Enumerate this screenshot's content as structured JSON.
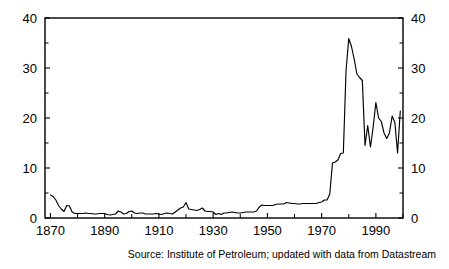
{
  "figure": {
    "background_color": "#ffffff",
    "line_color": "#000000",
    "source_note": "Source: Institute of Petroleum; updated with data from Datastream"
  },
  "chart_data": {
    "type": "line",
    "title": "",
    "subtitle": "",
    "xlabel": "",
    "ylabel": "",
    "xlim": [
      1868,
      2000
    ],
    "ylim": [
      0,
      40
    ],
    "grid": false,
    "legend": null,
    "axes": {
      "left": {
        "ticks": [
          0,
          10,
          20,
          30,
          40
        ],
        "tick_labels": [
          "0",
          "10",
          "20",
          "30",
          "40"
        ],
        "minor_ticks": [
          5,
          15,
          25,
          35
        ]
      },
      "right": {
        "ticks": [
          0,
          10,
          20,
          30,
          40
        ],
        "tick_labels": [
          "0",
          "10",
          "20",
          "30",
          "40"
        ],
        "minor_ticks": [
          5,
          15,
          25,
          35
        ]
      },
      "bottom": {
        "ticks": [
          1870,
          1890,
          1910,
          1930,
          1950,
          1970,
          1990
        ],
        "tick_labels": [
          "1870",
          "1890",
          "1910",
          "1930",
          "1950",
          "1970",
          "1990"
        ],
        "minor_ticks": [
          1880,
          1900,
          1920,
          1940,
          1960,
          1980,
          2000
        ]
      }
    },
    "series": [
      {
        "name": "Crude oil price",
        "x": [
          1870,
          1871,
          1872,
          1873,
          1874,
          1875,
          1876,
          1877,
          1878,
          1879,
          1880,
          1881,
          1882,
          1883,
          1884,
          1885,
          1886,
          1887,
          1888,
          1889,
          1890,
          1891,
          1892,
          1893,
          1894,
          1895,
          1896,
          1897,
          1898,
          1899,
          1900,
          1901,
          1902,
          1903,
          1904,
          1905,
          1906,
          1907,
          1908,
          1909,
          1910,
          1911,
          1912,
          1913,
          1914,
          1915,
          1916,
          1917,
          1918,
          1919,
          1920,
          1921,
          1922,
          1923,
          1924,
          1925,
          1926,
          1927,
          1928,
          1929,
          1930,
          1931,
          1932,
          1933,
          1934,
          1935,
          1936,
          1937,
          1938,
          1939,
          1940,
          1941,
          1942,
          1943,
          1944,
          1945,
          1946,
          1947,
          1948,
          1949,
          1950,
          1951,
          1952,
          1953,
          1954,
          1955,
          1956,
          1957,
          1958,
          1959,
          1960,
          1961,
          1962,
          1963,
          1964,
          1965,
          1966,
          1967,
          1968,
          1969,
          1970,
          1971,
          1972,
          1973,
          1974,
          1975,
          1976,
          1977,
          1978,
          1979,
          1980,
          1981,
          1982,
          1983,
          1984,
          1985,
          1986,
          1987,
          1988,
          1989,
          1990,
          1991,
          1992,
          1993,
          1994,
          1995,
          1996,
          1997,
          1998,
          1999
        ],
        "values": [
          4.6,
          4.3,
          3.6,
          2.5,
          1.8,
          1.3,
          2.5,
          2.4,
          1.2,
          0.9,
          0.9,
          0.9,
          0.9,
          1.0,
          0.9,
          0.9,
          0.8,
          0.8,
          0.9,
          0.9,
          0.9,
          0.7,
          0.6,
          0.7,
          0.8,
          1.4,
          1.2,
          0.8,
          0.9,
          1.3,
          1.4,
          1.0,
          0.9,
          1.0,
          1.0,
          0.8,
          0.8,
          0.8,
          0.8,
          0.9,
          0.8,
          0.7,
          0.9,
          1.0,
          0.9,
          0.8,
          1.2,
          1.6,
          2.0,
          2.2,
          3.1,
          1.8,
          1.7,
          1.6,
          1.5,
          1.7,
          2.0,
          1.4,
          1.3,
          1.3,
          1.2,
          0.7,
          0.9,
          0.7,
          1.0,
          1.0,
          1.1,
          1.2,
          1.1,
          1.0,
          1.0,
          1.1,
          1.2,
          1.2,
          1.2,
          1.2,
          1.4,
          2.2,
          2.6,
          2.5,
          2.5,
          2.5,
          2.5,
          2.7,
          2.8,
          2.8,
          2.8,
          3.1,
          3.0,
          2.9,
          2.9,
          2.8,
          2.8,
          2.9,
          2.9,
          2.9,
          2.9,
          2.9,
          2.9,
          3.1,
          3.2,
          3.6,
          3.6,
          4.8,
          11.0,
          11.2,
          11.6,
          12.9,
          13.0,
          29.5,
          35.9,
          34.3,
          31.8,
          28.8,
          28.1,
          27.5,
          14.5,
          18.5,
          14.2,
          18.2,
          23.1,
          20.0,
          19.3,
          17.0,
          15.9,
          17.0,
          20.4,
          19.1,
          13.0,
          21.4
        ],
        "units": "US dollars per barrel",
        "peak": {
          "year": 1980,
          "value": 35.9
        },
        "min_modern": {
          "year": 1986,
          "value": 14.5
        }
      }
    ]
  }
}
